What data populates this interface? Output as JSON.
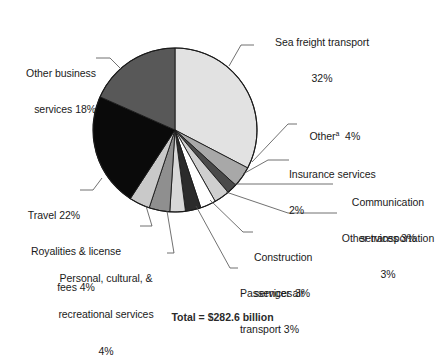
{
  "chart_data": {
    "type": "pie",
    "title": "",
    "subtitle": "",
    "xlabel": "",
    "ylabel": "",
    "legend_position": "none",
    "grid": false,
    "units": "percent",
    "start_angle_deg": 0,
    "direction": "clockwise",
    "categories": [
      "Sea freight transport",
      "Other",
      "Insurance services",
      "Communication services",
      "Other transportation",
      "Construction services",
      "Passenger air transport",
      "Personal, cultural, & recreational services",
      "Royalities & license fees",
      "Travel",
      "Other business services"
    ],
    "values": [
      32,
      4,
      2,
      3,
      3,
      3,
      3,
      4,
      4,
      22,
      18
    ],
    "slice_colors": [
      "#e2e2e2",
      "#a8a8a8",
      "#4a4a4a",
      "#cfcfcf",
      "#ffffff",
      "#2b2b2b",
      "#d8d8d8",
      "#8f8f8f",
      "#c9c9c9",
      "#0a0a0a",
      "#585858"
    ],
    "slices": [
      {
        "label": "Sea freight transport",
        "value": 32,
        "display": "32%",
        "color": "#e2e2e2"
      },
      {
        "label": "Other",
        "value": 4,
        "display": "4%",
        "color": "#a8a8a8",
        "footnote": "a"
      },
      {
        "label": "Insurance services",
        "value": 2,
        "display": "2%",
        "color": "#4a4a4a"
      },
      {
        "label": "Communication services",
        "value": 3,
        "display": "3%",
        "color": "#cfcfcf"
      },
      {
        "label": "Other transportation",
        "value": 3,
        "display": "3%",
        "color": "#ffffff"
      },
      {
        "label": "Construction services",
        "value": 3,
        "display": "3%",
        "color": "#2b2b2b"
      },
      {
        "label": "Passenger air transport",
        "value": 3,
        "display": "3%",
        "color": "#d8d8d8"
      },
      {
        "label": "Personal, cultural, & recreational services",
        "value": 4,
        "display": "4%",
        "color": "#8f8f8f"
      },
      {
        "label": "Royalities & license fees",
        "value": 4,
        "display": "4%",
        "color": "#c9c9c9"
      },
      {
        "label": "Travel",
        "value": 22,
        "display": "22%",
        "color": "#0a0a0a"
      },
      {
        "label": "Other business services",
        "value": 18,
        "display": "18%",
        "color": "#585858"
      }
    ]
  },
  "labels": {
    "sea_freight_line1": "Sea freight transport",
    "sea_freight_line2": "32%",
    "other_business_line1": "Other business",
    "other_business_line2": "services 18%",
    "travel": "Travel 22%",
    "royalties_line1": "Royalities & license",
    "royalties_line2": "fees 4%",
    "personal_line1": "Personal, cultural, &",
    "personal_line2": "recreational services",
    "personal_line3": "4%",
    "passenger_line1": "Passenger air",
    "passenger_line2": "transport 3%",
    "construction_line1": "Construction",
    "construction_line2": "services 3%",
    "other_transportation_line1": "Other transportation",
    "other_transportation_line2": "3%",
    "communication_line1": "Communication",
    "communication_line2": "services 3%",
    "insurance_line1": "Insurance services",
    "insurance_line2": "2%",
    "other_text": "Other",
    "other_sup": "a",
    "other_pct": "4%"
  },
  "footer": {
    "text": "Total = $282.6 billion"
  },
  "colors": {
    "outline": "#1a1a1a",
    "leader_line": "#4d4d4d",
    "text": "#1a1a1a",
    "background": "#ffffff"
  }
}
